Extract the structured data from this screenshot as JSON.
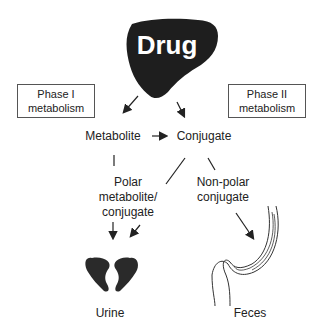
{
  "diagram": {
    "title_shape": "liver",
    "drug_label": "Drug",
    "phase1_box": {
      "line1": "Phase I",
      "line2": "metabolism"
    },
    "phase2_box": {
      "line1": "Phase II",
      "line2": "metabolism"
    },
    "nodes": {
      "metabolite": "Metabolite",
      "conjugate": "Conjugate",
      "polar": {
        "line1": "Polar",
        "line2": "metabolite/",
        "line3": "conjugate"
      },
      "nonpolar": {
        "line1": "Non-polar",
        "line2": "conjugate"
      },
      "urine": "Urine",
      "feces": "Feces"
    },
    "icons": [
      "liver-icon",
      "kidneys-icon",
      "intestine-icon"
    ],
    "edges": [
      [
        "Drug",
        "Metabolite"
      ],
      [
        "Drug",
        "Conjugate"
      ],
      [
        "Metabolite",
        "Conjugate"
      ],
      [
        "Metabolite",
        "Polar metabolite/conjugate"
      ],
      [
        "Conjugate",
        "Polar metabolite/conjugate"
      ],
      [
        "Conjugate",
        "Non-polar conjugate"
      ],
      [
        "Polar metabolite/conjugate",
        "Urine"
      ],
      [
        "Non-polar conjugate",
        "Feces"
      ]
    ]
  }
}
